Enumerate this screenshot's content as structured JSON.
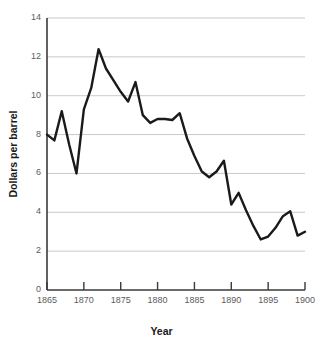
{
  "chart_data": {
    "type": "line",
    "title": "",
    "xlabel": "Year",
    "ylabel": "Dollars per barrel",
    "xlim": [
      1865,
      1900
    ],
    "ylim": [
      0,
      14
    ],
    "grid": true,
    "legend": null,
    "xticks": [
      1865,
      1870,
      1875,
      1880,
      1885,
      1890,
      1895,
      1900
    ],
    "xtick_labels": [
      "1865",
      "1870",
      "1875",
      "1880",
      "1885",
      "1890",
      "1895",
      "1900"
    ],
    "yticks": [
      0,
      2,
      4,
      6,
      8,
      10,
      12,
      14
    ],
    "ytick_labels": [
      "0",
      "2",
      "4",
      "6",
      "8",
      "10",
      "12",
      "14"
    ],
    "line_color": "#1a1a1a",
    "line_width": 2.4,
    "x": [
      1865,
      1866,
      1867,
      1868,
      1869,
      1870,
      1871,
      1872,
      1873,
      1874,
      1875,
      1876,
      1877,
      1878,
      1879,
      1880,
      1881,
      1882,
      1883,
      1884,
      1885,
      1886,
      1887,
      1888,
      1889,
      1890,
      1891,
      1892,
      1893,
      1894,
      1895,
      1896,
      1897,
      1898,
      1899,
      1900
    ],
    "values": [
      8.0,
      7.7,
      9.2,
      7.5,
      6.0,
      9.3,
      10.4,
      12.4,
      11.4,
      10.8,
      10.2,
      9.7,
      10.7,
      9.0,
      8.6,
      8.8,
      8.8,
      8.75,
      9.1,
      7.8,
      6.9,
      6.1,
      5.8,
      6.1,
      6.65,
      4.4,
      5.0,
      4.1,
      3.3,
      2.6,
      2.75,
      3.2,
      3.8,
      4.05,
      2.8,
      3.0
    ],
    "series": [
      {
        "name": "Dollars per barrel",
        "values": [
          8.0,
          7.7,
          9.2,
          7.5,
          6.0,
          9.3,
          10.4,
          12.4,
          11.4,
          10.8,
          10.2,
          9.7,
          10.7,
          9.0,
          8.6,
          8.8,
          8.8,
          8.75,
          9.1,
          7.8,
          6.9,
          6.1,
          5.8,
          6.1,
          6.65,
          4.4,
          5.0,
          4.1,
          3.3,
          2.6,
          2.75,
          3.2,
          3.8,
          4.05,
          2.8,
          3.0
        ]
      }
    ],
    "colors": {
      "line": "#1a1a1a",
      "grid": "#c9c9c9",
      "axis": "#3a3a3a",
      "tick_text": "#5b5b5b",
      "title_text": "#1a1a1a",
      "background": "#ffffff"
    }
  }
}
